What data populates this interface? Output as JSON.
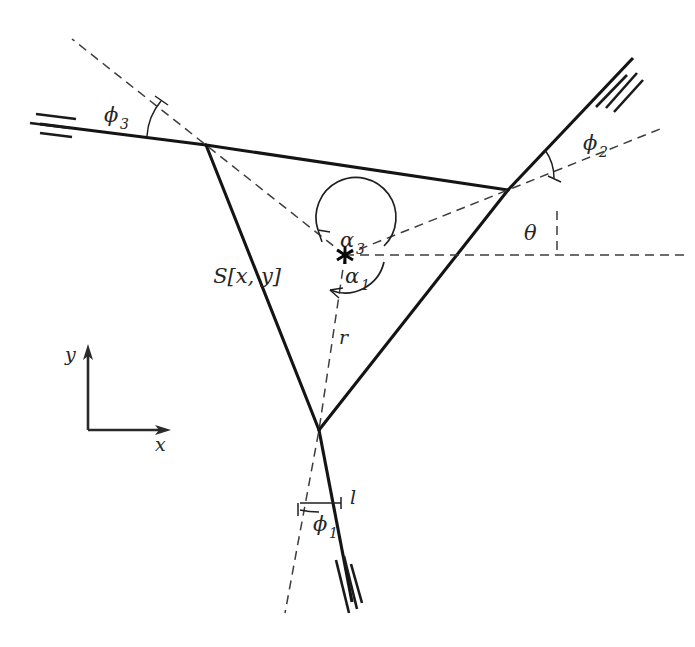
{
  "figure": {
    "type": "geometric-diagram",
    "background_color": "#ffffff",
    "stroke_color": "#141414",
    "dash_color": "#3d3d3d"
  },
  "labels": {
    "center_point": "S[x, y]",
    "radius": "r",
    "length": "l",
    "theta": "θ",
    "phi1": "ϕ",
    "phi1_sub": "1",
    "phi2": "ϕ",
    "phi2_sub": "2",
    "phi3": "ϕ",
    "phi3_sub": "3",
    "alpha1": "α",
    "alpha1_sub": "1",
    "alpha3": "α",
    "alpha3_sub": "3",
    "axis_x": "x",
    "axis_y": "y"
  },
  "geometry": {
    "center": {
      "x": 345,
      "y": 255
    },
    "vertices": [
      {
        "name": "vertex-top-left",
        "x": 206,
        "y": 145
      },
      {
        "name": "vertex-top-right",
        "x": 508,
        "y": 190
      },
      {
        "name": "vertex-bottom",
        "x": 319,
        "y": 430
      }
    ],
    "arms": [
      {
        "name": "arm-left",
        "from": {
          "x": 206,
          "y": 145
        },
        "to": {
          "x": 40,
          "y": 124
        }
      },
      {
        "name": "arm-upper-right",
        "from": {
          "x": 508,
          "y": 190
        },
        "to": {
          "x": 633,
          "y": 58
        }
      },
      {
        "name": "arm-bottom",
        "from": {
          "x": 319,
          "y": 430
        },
        "to": {
          "x": 352,
          "y": 602
        }
      }
    ],
    "reference_line": {
      "from": {
        "x": 345,
        "y": 255
      },
      "to": {
        "x": 688,
        "y": 255
      }
    },
    "axis_origin": {
      "x": 88,
      "y": 430
    }
  },
  "annotations": [
    {
      "name": "angle-phi3",
      "symbol": "ϕ₃",
      "at_vertex": "vertex-top-left"
    },
    {
      "name": "angle-phi2",
      "symbol": "ϕ₂",
      "at_vertex": "vertex-top-right"
    },
    {
      "name": "angle-phi1",
      "symbol": "ϕ₁",
      "at_vertex": "vertex-bottom"
    },
    {
      "name": "angle-theta",
      "symbol": "θ",
      "at_vertex": "reference-horizontal"
    },
    {
      "name": "angle-alpha3",
      "symbol": "α₃",
      "at_vertex": "center"
    },
    {
      "name": "angle-alpha1",
      "symbol": "α₁",
      "at_vertex": "center"
    }
  ]
}
